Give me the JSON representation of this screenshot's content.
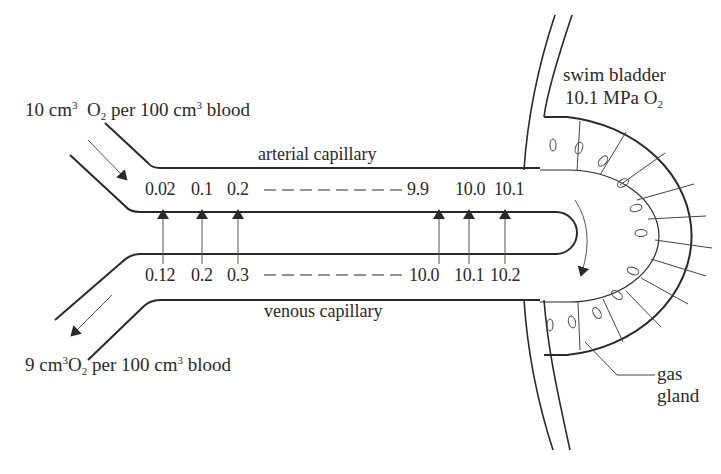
{
  "labels": {
    "inflow": {
      "pre": "10 cm",
      "sup": "3",
      "mid": "O",
      "sub": "2",
      "post": " per 100 cm",
      "sup2": "3",
      "end": " blood"
    },
    "outflow": {
      "pre": "9 cm",
      "sup": "3",
      "mid": "O",
      "sub": "2",
      "post": " per 100 cm",
      "sup2": "3",
      "end": " blood"
    },
    "arterial": "arterial capillary",
    "venous": "venous capillary",
    "swim_bladder_line1": "swim bladder",
    "swim_bladder_line2_pre": "10.1 MPa O",
    "swim_bladder_line2_sub": "2",
    "gas_gland_line1": "gas",
    "gas_gland_line2": "gland"
  },
  "arterial_values": [
    "0.02",
    "0.1",
    "0.2",
    "9.9",
    "10.0",
    "10.1"
  ],
  "venous_values": [
    "0.12",
    "0.2",
    "0.3",
    "10.0",
    "10.1",
    "10.2"
  ],
  "colors": {
    "ink": "#2a2a2a",
    "thin": "#555555",
    "background": "#ffffff"
  }
}
